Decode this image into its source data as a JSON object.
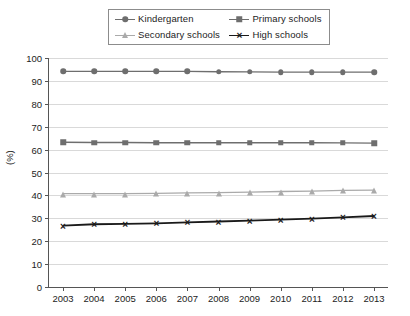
{
  "chart_data": {
    "type": "line",
    "title": "",
    "xlabel": "",
    "ylabel": "(%)",
    "ylim": [
      0,
      100
    ],
    "ytick_step": 10,
    "yticks": [
      "0",
      "10",
      "20",
      "30",
      "40",
      "50",
      "60",
      "70",
      "80",
      "90",
      "100"
    ],
    "grid": true,
    "legend_position": "top-center",
    "categories": [
      "2003",
      "2004",
      "2005",
      "2006",
      "2007",
      "2008",
      "2009",
      "2010",
      "2011",
      "2012",
      "2013"
    ],
    "series": [
      {
        "name": "Kindergarten",
        "marker": "circle",
        "color": "#6e6e6e",
        "values": [
          94.2,
          94.2,
          94.2,
          94.2,
          94.2,
          94.0,
          93.9,
          93.8,
          93.8,
          93.8,
          93.8
        ]
      },
      {
        "name": "Primary schools",
        "marker": "square",
        "color": "#6e6e6e",
        "values": [
          63.2,
          63.1,
          63.1,
          63.0,
          63.0,
          63.0,
          63.0,
          63.0,
          63.0,
          62.9,
          62.8
        ]
      },
      {
        "name": "Secondary schools",
        "marker": "triangle",
        "color": "#aaaaaa",
        "values": [
          40.8,
          40.8,
          40.8,
          40.9,
          41.1,
          41.2,
          41.4,
          41.7,
          41.9,
          42.2,
          42.3
        ]
      },
      {
        "name": "High schools",
        "marker": "cross",
        "color": "#1a1a1a",
        "values": [
          26.8,
          27.4,
          27.6,
          27.8,
          28.2,
          28.6,
          29.0,
          29.4,
          29.9,
          30.4,
          31.0
        ]
      }
    ]
  },
  "legend": {
    "entries": [
      {
        "label": "Kindergarten"
      },
      {
        "label": "Primary schools"
      },
      {
        "label": "Secondary schools"
      },
      {
        "label": "High schools"
      }
    ]
  },
  "axes": {
    "y_title": "(%)"
  }
}
